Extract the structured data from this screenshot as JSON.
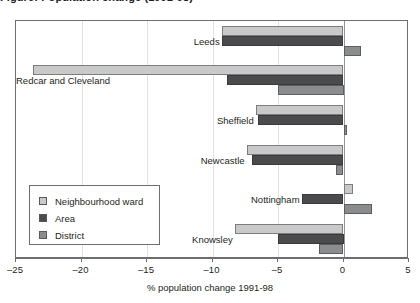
{
  "figure": {
    "title": "Figure: Population change (1991-98)",
    "title_clipped": true
  },
  "chart_data": {
    "type": "bar",
    "orientation": "horizontal",
    "title": "Figure: Population change (1991-98)",
    "xlabel": "% population change 1991-98",
    "ylabel": "",
    "xlim": [
      -25,
      5
    ],
    "xticks": [
      -25,
      -20,
      -15,
      -10,
      -5,
      0,
      5
    ],
    "xticklabels": [
      "–25",
      "–20",
      "–15",
      "–10",
      "–5",
      "0",
      "5"
    ],
    "grid": true,
    "legend_position": "lower left",
    "categories": [
      "Leeds",
      "Redcar and Cleveland",
      "Sheffield",
      "Newcastle",
      "Nottingham",
      "Knowsley"
    ],
    "series": [
      {
        "name": "Neighbourhood ward",
        "color": "#c9c9c9",
        "values": [
          -9.3,
          -23.7,
          -6.7,
          -7.4,
          0.7,
          -8.3
        ]
      },
      {
        "name": "Area",
        "color": "#4b4b4d",
        "values": [
          -9.3,
          -8.9,
          -6.5,
          -7.0,
          -3.2,
          -5.0
        ]
      },
      {
        "name": "District",
        "color": "#8b8c8e",
        "values": [
          1.3,
          -5.0,
          0.3,
          -0.6,
          2.2,
          -1.9
        ]
      }
    ]
  },
  "axis": {
    "title": "% population change 1991-98"
  },
  "legend": {
    "items": [
      {
        "label": "Neighbourhood ward",
        "color": "#c9c9c9"
      },
      {
        "label": "Area",
        "color": "#4b4b4d"
      },
      {
        "label": "District",
        "color": "#8b8c8e"
      }
    ]
  }
}
